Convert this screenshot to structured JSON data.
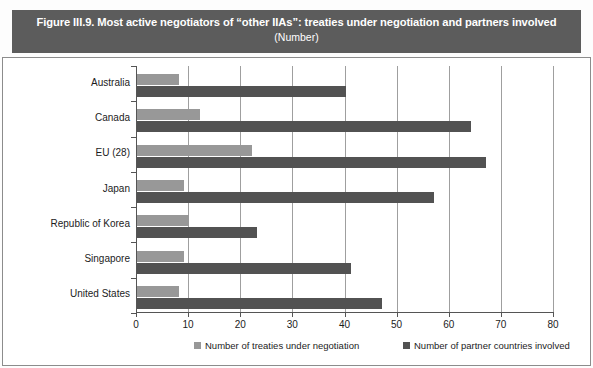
{
  "title": {
    "main": "Figure III.9. Most active negotiators of “other IIAs”: treaties under negotiation and partners involved",
    "sub": "(Number)"
  },
  "colors": {
    "banner_background": "#5c5c5c",
    "banner_text": "#ffffff",
    "series_treaties": "#989898",
    "series_partners": "#525252",
    "gridline": "#9f9f9f",
    "axis": "#555555",
    "frame_border": "#8c8c8c"
  },
  "chart_data": {
    "type": "bar",
    "orientation": "horizontal",
    "title": "Figure III.9. Most active negotiators of “other IIAs”: treaties under negotiation and partners involved",
    "subtitle": "(Number)",
    "xlabel": "",
    "ylabel": "",
    "xlim": [
      0,
      80
    ],
    "xticks": [
      0,
      10,
      20,
      30,
      40,
      50,
      60,
      70,
      80
    ],
    "xtick_labels": [
      "0",
      "10",
      "20",
      "30",
      "40",
      "50",
      "60",
      "70",
      "80"
    ],
    "grid": true,
    "grid_axis": "x",
    "legend_position": "bottom",
    "categories": [
      "Australia",
      "Canada",
      "EU (28)",
      "Japan",
      "Republic of Korea",
      "Singapore",
      "United States"
    ],
    "series": [
      {
        "name": "Number of treaties under negotiation",
        "color": "#989898",
        "values": [
          8,
          12,
          22,
          9,
          10,
          9,
          8
        ]
      },
      {
        "name": "Number of partner countries involved",
        "color": "#525252",
        "values": [
          40,
          64,
          67,
          57,
          23,
          41,
          47
        ]
      }
    ]
  }
}
